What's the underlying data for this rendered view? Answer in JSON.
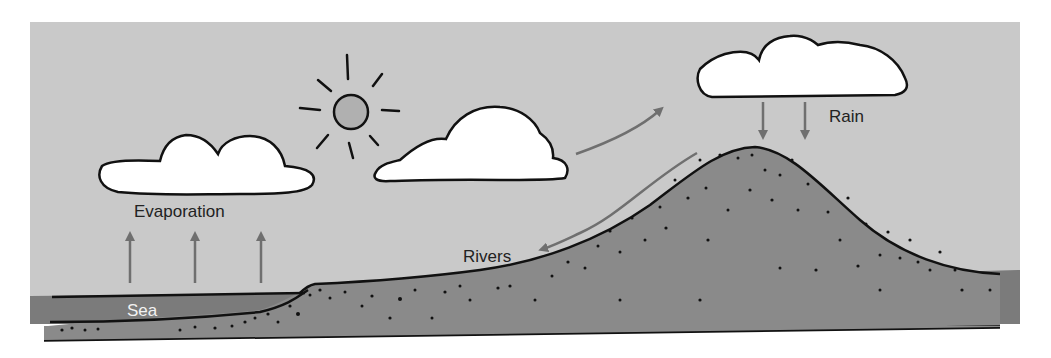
{
  "diagram": {
    "labels": {
      "evaporation": "Evaporation",
      "rain": "Rain",
      "rivers": "Rivers",
      "sea": "Sea"
    },
    "colors": {
      "sky": "#c9c9c9",
      "sea": "#7b7b7b",
      "ground": "#8a8a8a",
      "sun": "#b0b0b0",
      "cloud": "#ffffff",
      "arrow": "#6f6f6f",
      "outline": "#111111"
    },
    "elements": {
      "sun": "sun-icon",
      "clouds": [
        "cloud-left",
        "cloud-middle",
        "cloud-right"
      ],
      "arrows": [
        "evaporation-arrows",
        "cloud-movement-arrow",
        "rain-arrows",
        "river-flow-arrow"
      ],
      "landforms": [
        "sea",
        "lowland",
        "mountain"
      ]
    }
  }
}
